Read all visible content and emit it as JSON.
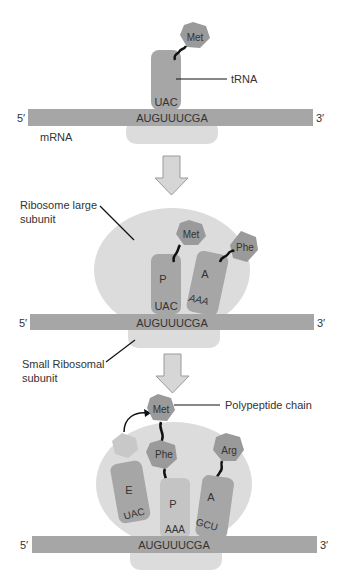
{
  "diagram": {
    "colors": {
      "mrna": "#a6a6a6",
      "trna": "#a6a6a6",
      "trna_light": "#c4c4c4",
      "amino_acid": "#9a9a9a",
      "ribosome": "#dcdcdc",
      "arrow_fill": "#d6d6d6",
      "text": "#333333"
    },
    "stage1": {
      "five_prime": "5′",
      "three_prime": "3′",
      "mrna_seq": "AUGUUUCGA",
      "mrna_label": "mRNA",
      "trna_label": "tRNA",
      "anticodon": "UAC",
      "amino_acid": "Met"
    },
    "stage2": {
      "five_prime": "5′",
      "three_prime": "3′",
      "mrna_seq": "AUGUUUCGA",
      "large_subunit_label_line1": "Ribosome large",
      "large_subunit_label_line2": "subunit",
      "small_subunit_label_line1": "Small Ribosomal",
      "small_subunit_label_line2": "subunit",
      "p_site": {
        "label": "P",
        "anticodon": "UAC",
        "amino_acid": "Met"
      },
      "a_site": {
        "label": "A",
        "anticodon": "AAA",
        "amino_acid": "Phe"
      }
    },
    "stage3": {
      "five_prime": "5′",
      "three_prime": "3′",
      "mrna_seq": "AUGUUUCGA",
      "polypeptide_label": "Polypeptide chain",
      "chain_top": "Met",
      "e_site": {
        "label": "E",
        "anticodon": "UAC"
      },
      "p_site": {
        "label": "P",
        "anticodon": "AAA",
        "amino_acid": "Phe"
      },
      "a_site": {
        "label": "A",
        "anticodon": "GCU",
        "amino_acid": "Arg"
      }
    }
  }
}
